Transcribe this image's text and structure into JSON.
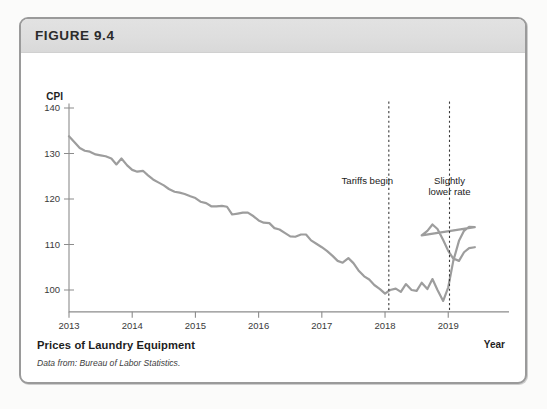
{
  "figure": {
    "number_label": "FIGURE 9.4",
    "title": "Prices of Laundry Equipment",
    "source": "Data from: Bureau of Labor Statistics."
  },
  "chart_data": {
    "type": "line",
    "title": "Prices of Laundry Equipment",
    "xlabel": "Year",
    "ylabel": "CPI",
    "xlim": [
      2013.0,
      2019.55
    ],
    "ylim": [
      95,
      141
    ],
    "grid": false,
    "legend": null,
    "y_ticks": [
      100,
      110,
      120,
      130,
      140
    ],
    "x_ticks": [
      2013,
      2014,
      2015,
      2016,
      2017,
      2018,
      2019
    ],
    "x_tick_labels": [
      "2013",
      "2014",
      "2015",
      "2016",
      "2017",
      "2018",
      "2019"
    ],
    "y_tick_labels": [
      "100",
      "110",
      "120",
      "130",
      "140"
    ],
    "line_color": "#9d9d9d",
    "axis_color": "#8c8c8c",
    "annotations": [
      {
        "label": "Tariffs begin",
        "x": 2018.06,
        "text_x": 2017.72,
        "text_y": 123.2
      },
      {
        "label_line1": "Slightly",
        "label_line2": "lower rate",
        "x": 2019.02,
        "text_x": 2019.02,
        "text_y": 123.2
      }
    ],
    "series": [
      {
        "name": "CPI: Laundry Equipment",
        "x": [
          2013.0,
          2013.08,
          2013.17,
          2013.25,
          2013.33,
          2013.42,
          2013.5,
          2013.58,
          2013.67,
          2013.75,
          2013.83,
          2013.92,
          2014.0,
          2014.08,
          2014.17,
          2014.25,
          2014.33,
          2014.42,
          2014.5,
          2014.58,
          2014.67,
          2014.75,
          2014.83,
          2014.92,
          2015.0,
          2015.08,
          2015.17,
          2015.25,
          2015.33,
          2015.42,
          2015.5,
          2015.58,
          2015.67,
          2015.75,
          2015.83,
          2015.92,
          2016.0,
          2016.08,
          2016.17,
          2016.25,
          2016.33,
          2016.42,
          2016.5,
          2016.58,
          2016.67,
          2016.75,
          2016.83,
          2016.92,
          2017.0,
          2017.08,
          2017.17,
          2017.25,
          2017.33,
          2017.42,
          2017.5,
          2017.58,
          2017.67,
          2017.75,
          2017.83,
          2017.92,
          2018.0,
          2018.08,
          2018.17,
          2018.25,
          2018.33,
          2018.42,
          2018.5,
          2018.58,
          2018.67,
          2018.75,
          2018.83,
          2018.92,
          2019.0,
          2019.08,
          2019.17,
          2019.25,
          2019.33,
          2019.42
        ],
        "values": [
          133.8,
          132.6,
          131.2,
          130.6,
          130.4,
          129.8,
          129.6,
          129.4,
          128.9,
          127.6,
          128.9,
          127.4,
          126.4,
          126.0,
          126.2,
          125.2,
          124.3,
          123.6,
          123.0,
          122.2,
          121.6,
          121.4,
          121.1,
          120.6,
          120.2,
          119.4,
          119.1,
          118.4,
          118.4,
          118.5,
          118.3,
          116.6,
          116.8,
          117.0,
          117.0,
          116.2,
          115.3,
          114.8,
          114.7,
          113.6,
          113.3,
          112.5,
          111.8,
          111.7,
          112.2,
          112.2,
          110.9,
          110.1,
          109.4,
          108.6,
          107.5,
          106.4,
          106.0,
          107.0,
          105.9,
          104.3,
          103.0,
          102.3,
          101.1,
          100.2,
          99.2,
          100.0,
          100.3,
          99.6,
          101.3,
          100.0,
          99.8,
          101.6,
          100.2,
          102.4,
          100.0,
          97.6,
          100.6,
          106.4,
          110.8,
          113.0,
          113.9,
          113.8
        ]
      }
    ],
    "series_tail": {
      "note": "continuation after 2019 marker",
      "x": [
        2018.5,
        2018.58,
        2018.67,
        2018.75,
        2018.83,
        2018.92,
        2019.0,
        2019.08,
        2019.17,
        2019.25,
        2019.33,
        2019.42
      ],
      "values": [
        113.9,
        112.0,
        113.0,
        114.4,
        113.4,
        111.0,
        108.6,
        106.9,
        106.4,
        108.3,
        109.2,
        109.4
      ]
    }
  }
}
